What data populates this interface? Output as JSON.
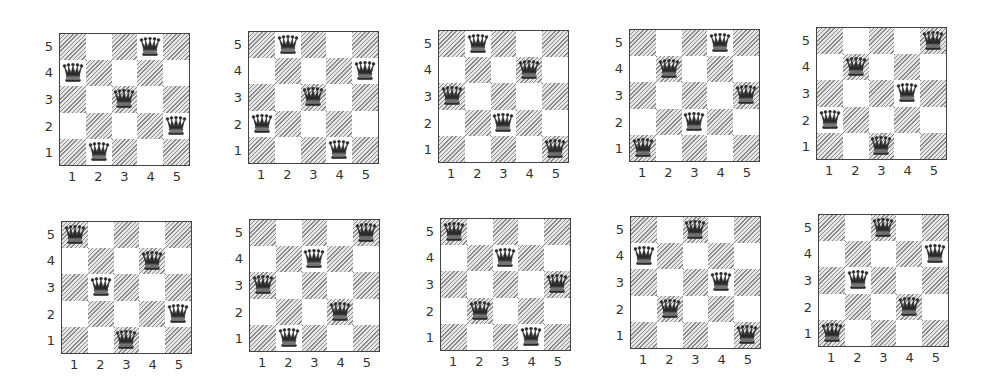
{
  "figure": {
    "board_size": 5,
    "row_labels": [
      "5",
      "4",
      "3",
      "2",
      "1"
    ],
    "col_labels": [
      "1",
      "2",
      "3",
      "4",
      "5"
    ],
    "colors": {
      "shaded": "#8a8a8a",
      "light": "#ffffff",
      "border": "#444444",
      "queen": "#2a2a2a"
    },
    "boards": [
      {
        "id": 1,
        "left": 59,
        "top": 33,
        "queens_by_row_top_to_bottom": [
          4,
          1,
          3,
          5,
          2
        ]
      },
      {
        "id": 2,
        "left": 248,
        "top": 31,
        "queens_by_row_top_to_bottom": [
          2,
          5,
          3,
          1,
          4
        ]
      },
      {
        "id": 3,
        "left": 438,
        "top": 30,
        "queens_by_row_top_to_bottom": [
          2,
          4,
          1,
          3,
          5
        ]
      },
      {
        "id": 4,
        "left": 629,
        "top": 29,
        "queens_by_row_top_to_bottom": [
          4,
          2,
          5,
          3,
          1
        ]
      },
      {
        "id": 5,
        "left": 816,
        "top": 27,
        "queens_by_row_top_to_bottom": [
          5,
          2,
          4,
          1,
          3
        ]
      },
      {
        "id": 6,
        "left": 61,
        "top": 221,
        "queens_by_row_top_to_bottom": [
          1,
          4,
          2,
          5,
          3
        ]
      },
      {
        "id": 7,
        "left": 249,
        "top": 219,
        "queens_by_row_top_to_bottom": [
          5,
          3,
          1,
          4,
          2
        ]
      },
      {
        "id": 8,
        "left": 440,
        "top": 218,
        "queens_by_row_top_to_bottom": [
          1,
          3,
          5,
          2,
          4
        ]
      },
      {
        "id": 9,
        "left": 630,
        "top": 216,
        "queens_by_row_top_to_bottom": [
          3,
          1,
          4,
          2,
          5
        ]
      },
      {
        "id": 10,
        "left": 818,
        "top": 214,
        "queens_by_row_top_to_bottom": [
          3,
          5,
          2,
          4,
          1
        ]
      }
    ]
  }
}
